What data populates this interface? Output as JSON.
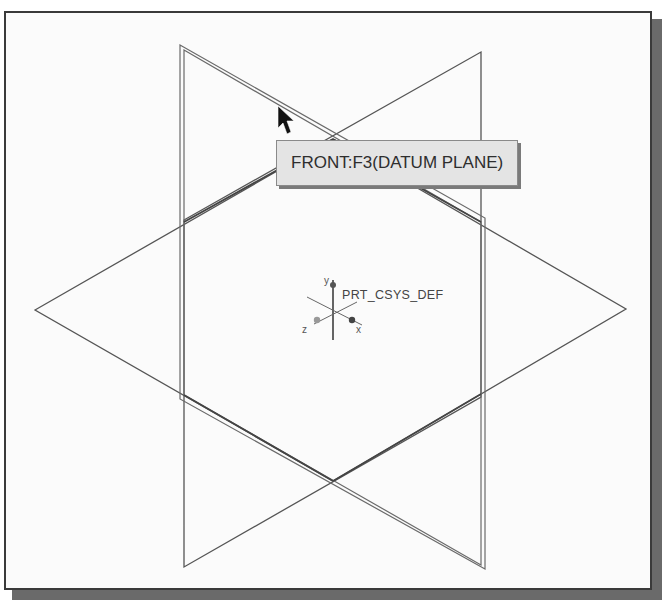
{
  "viewport": {
    "background": "#fbfbfb",
    "border_color": "#3a3a3a"
  },
  "tooltip": {
    "text": "FRONT:F3(DATUM PLANE)"
  },
  "coordinate_system": {
    "label": "PRT_CSYS_DEF",
    "axes": {
      "x": "x",
      "y": "y",
      "z": "z"
    }
  },
  "datum_planes": [
    {
      "name": "FRONT",
      "highlighted": true
    },
    {
      "name": "RIGHT",
      "highlighted": false
    },
    {
      "name": "TOP",
      "highlighted": false
    }
  ],
  "cursor": {
    "type": "arrow-pointer"
  }
}
